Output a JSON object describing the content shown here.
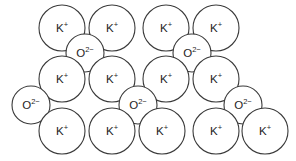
{
  "figure": {
    "name": "potassium-oxide-ionic-lattice",
    "background_color": "#ffffff",
    "stroke_color": "#3a3a3a",
    "text_color": "#1e1e1e",
    "width": 296,
    "height": 161
  },
  "species": {
    "cation": {
      "key": "K",
      "base": "K",
      "charge": "+",
      "label": "K+",
      "radius": 23
    },
    "anion": {
      "key": "O",
      "base": "O",
      "charge": "2−",
      "label": "O2−",
      "radius": 19
    }
  },
  "ions": [
    {
      "id": "k-r1-c1",
      "type": "K",
      "base": "K",
      "charge": "+",
      "cx": 62,
      "cy": 28,
      "r": 23
    },
    {
      "id": "k-r1-c2",
      "type": "K",
      "base": "K",
      "charge": "+",
      "cx": 112,
      "cy": 28,
      "r": 23
    },
    {
      "id": "k-r1-c3",
      "type": "K",
      "base": "K",
      "charge": "+",
      "cx": 166,
      "cy": 28,
      "r": 23
    },
    {
      "id": "k-r1-c4",
      "type": "K",
      "base": "K",
      "charge": "+",
      "cx": 216,
      "cy": 28,
      "r": 23
    },
    {
      "id": "o-r2-c1",
      "type": "O",
      "base": "O",
      "charge": "2−",
      "cx": 85,
      "cy": 53,
      "r": 19
    },
    {
      "id": "o-r2-c2",
      "type": "O",
      "base": "O",
      "charge": "2−",
      "cx": 192,
      "cy": 53,
      "r": 19
    },
    {
      "id": "k-r3-c1",
      "type": "K",
      "base": "K",
      "charge": "+",
      "cx": 62,
      "cy": 79,
      "r": 23
    },
    {
      "id": "k-r3-c2",
      "type": "K",
      "base": "K",
      "charge": "+",
      "cx": 112,
      "cy": 79,
      "r": 23
    },
    {
      "id": "k-r3-c3",
      "type": "K",
      "base": "K",
      "charge": "+",
      "cx": 166,
      "cy": 79,
      "r": 23
    },
    {
      "id": "k-r3-c4",
      "type": "K",
      "base": "K",
      "charge": "+",
      "cx": 216,
      "cy": 79,
      "r": 23
    },
    {
      "id": "o-r4-c1",
      "type": "O",
      "base": "O",
      "charge": "2−",
      "cx": 31,
      "cy": 105,
      "r": 19
    },
    {
      "id": "o-r4-c2",
      "type": "O",
      "base": "O",
      "charge": "2−",
      "cx": 138,
      "cy": 105,
      "r": 19
    },
    {
      "id": "o-r4-c3",
      "type": "O",
      "base": "O",
      "charge": "2−",
      "cx": 243,
      "cy": 105,
      "r": 19
    },
    {
      "id": "k-r5-c1",
      "type": "K",
      "base": "K",
      "charge": "+",
      "cx": 62,
      "cy": 131,
      "r": 23
    },
    {
      "id": "k-r5-c2",
      "type": "K",
      "base": "K",
      "charge": "+",
      "cx": 112,
      "cy": 131,
      "r": 23
    },
    {
      "id": "k-r5-c3",
      "type": "K",
      "base": "K",
      "charge": "+",
      "cx": 162,
      "cy": 131,
      "r": 23
    },
    {
      "id": "k-r5-c4",
      "type": "K",
      "base": "K",
      "charge": "+",
      "cx": 216,
      "cy": 131,
      "r": 23
    },
    {
      "id": "k-r5-c5",
      "type": "K",
      "base": "K",
      "charge": "+",
      "cx": 265,
      "cy": 131,
      "r": 23
    }
  ],
  "counts": {
    "cation_total": 13,
    "anion_total": 5,
    "total_ions": 18
  }
}
